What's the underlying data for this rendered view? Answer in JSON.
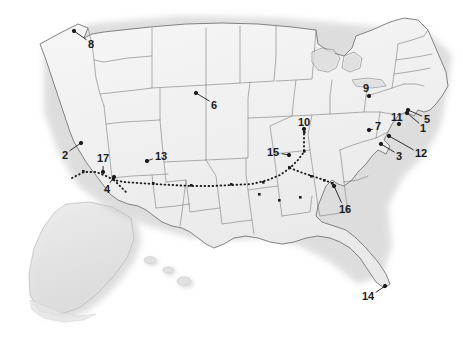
{
  "map": {
    "title": "United States annotated reference map",
    "region": "United States of America",
    "projection_note": "contiguous 48 states with Alaska and Hawaii insets at lower left",
    "style": {
      "background_color": "#ffffff",
      "land_fill": "#f0f0f0",
      "land_fill_highlight": "#f7f7f7",
      "state_border_color": "#8a8a8a",
      "coast_border_color": "#707070",
      "shadow_color": "#c9c9c9",
      "inset_fill": "#e3e3e3",
      "label_color": "#1b1b1b",
      "leader_color": "#1b1b1b",
      "trail_color": "#1b1b1b"
    },
    "insets": [
      {
        "name": "alaska-inset",
        "label": ""
      },
      {
        "name": "hawaii-inset",
        "label": ""
      }
    ],
    "trail": {
      "name": "dotted-route",
      "style": "dotted",
      "marker_shape": "square",
      "description": "dotted route running from the southwest across the southern plains and turning northeast",
      "waypoint_count": 12
    },
    "labels": [
      {
        "id": "1",
        "text": "1",
        "x": 420,
        "y": 123,
        "tip_x": 407,
        "tip_y": 113,
        "region": "New Jersey / New York Harbor"
      },
      {
        "id": "2",
        "text": "2",
        "x": 62,
        "y": 150,
        "tip_x": 81,
        "tip_y": 143,
        "region": "eastern California / Nevada border"
      },
      {
        "id": "3",
        "text": "3",
        "x": 396,
        "y": 151,
        "tip_x": 381,
        "tip_y": 144,
        "region": "Virginia"
      },
      {
        "id": "4",
        "text": "4",
        "x": 104,
        "y": 184,
        "tip_x": 114,
        "tip_y": 177,
        "region": "southern Nevada / Colorado River"
      },
      {
        "id": "5",
        "text": "5",
        "x": 424,
        "y": 114,
        "tip_x": 408,
        "tip_y": 110,
        "region": "Long Island / Connecticut coast"
      },
      {
        "id": "6",
        "text": "6",
        "x": 211,
        "y": 100,
        "tip_x": 196,
        "tip_y": 93,
        "region": "South Dakota / Nebraska"
      },
      {
        "id": "7",
        "text": "7",
        "x": 375,
        "y": 121,
        "tip_x": 369,
        "tip_y": 130,
        "region": "Pennsylvania"
      },
      {
        "id": "8",
        "text": "8",
        "x": 88,
        "y": 39,
        "tip_x": 74,
        "tip_y": 31,
        "region": "Puget Sound, Washington"
      },
      {
        "id": "9",
        "text": "9",
        "x": 363,
        "y": 83,
        "tip_x": 369,
        "tip_y": 96,
        "region": "Lake Erie / western New York"
      },
      {
        "id": "10",
        "text": "10",
        "x": 298,
        "y": 117,
        "tip_x": 304,
        "tip_y": 129,
        "region": "Chicago, Illinois"
      },
      {
        "id": "11",
        "text": "11",
        "x": 391,
        "y": 112,
        "tip_x": 399,
        "tip_y": 124,
        "region": "New York / New Jersey"
      },
      {
        "id": "12",
        "text": "12",
        "x": 415,
        "y": 148,
        "tip_x": 389,
        "tip_y": 136,
        "region": "Delaware / Maryland"
      },
      {
        "id": "13",
        "text": "13",
        "x": 155,
        "y": 151,
        "tip_x": 147,
        "tip_y": 161,
        "region": "Four Corners, Colorado"
      },
      {
        "id": "14",
        "text": "14",
        "x": 362,
        "y": 291,
        "tip_x": 385,
        "tip_y": 286,
        "region": "southern Florida"
      },
      {
        "id": "15",
        "text": "15",
        "x": 267,
        "y": 147,
        "tip_x": 289,
        "tip_y": 155,
        "region": "St. Louis, Missouri"
      },
      {
        "id": "16",
        "text": "16",
        "x": 339,
        "y": 204,
        "tip_x": 334,
        "tip_y": 186,
        "region": "Chattanooga / north Georgia"
      },
      {
        "id": "17",
        "text": "17",
        "x": 97,
        "y": 153,
        "tip_x": 103,
        "tip_y": 172,
        "region": "southern Utah / Nevada"
      }
    ]
  }
}
